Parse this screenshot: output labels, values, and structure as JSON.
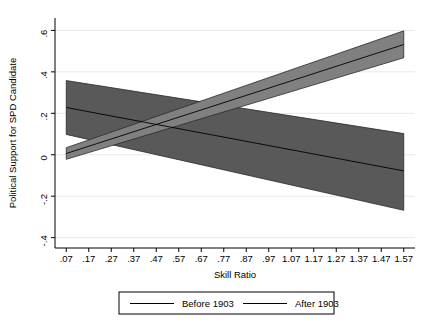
{
  "chart_data": {
    "type": "area",
    "title": "",
    "subtitle": "",
    "xlabel": "Skill Ratio",
    "ylabel": "Political Support for SPD Candidate",
    "xlim": [
      0.02,
      1.62
    ],
    "ylim": [
      -0.45,
      0.66
    ],
    "grid": true,
    "grid_orientation": "horizontal",
    "legend_position": "bottom",
    "x_ticks": [
      ".07",
      ".17",
      ".27",
      ".37",
      ".47",
      ".57",
      ".67",
      ".77",
      ".87",
      ".97",
      "1.07",
      "1.17",
      "1.27",
      "1.37",
      "1.47",
      "1.57"
    ],
    "x_tick_values": [
      0.07,
      0.17,
      0.27,
      0.37,
      0.47,
      0.57,
      0.67,
      0.77,
      0.87,
      0.97,
      1.07,
      1.17,
      1.27,
      1.37,
      1.47,
      1.57
    ],
    "y_ticks": [
      "-.4",
      "-.2",
      "0",
      ".2",
      ".4",
      ".6"
    ],
    "y_tick_values": [
      -0.4,
      -0.2,
      0,
      0.2,
      0.4,
      0.6
    ],
    "series": [
      {
        "name": "Before 1903",
        "color": "#595959",
        "x": [
          0.07,
          1.57
        ],
        "values": [
          0.228,
          -0.078
        ],
        "ci_lower": [
          0.098,
          -0.268
        ],
        "ci_upper": [
          0.358,
          0.102
        ]
      },
      {
        "name": "After 1903",
        "color": "#808080",
        "x": [
          0.07,
          1.57
        ],
        "values": [
          0.006,
          0.532
        ],
        "ci_lower": [
          -0.022,
          0.468
        ],
        "ci_upper": [
          0.034,
          0.598
        ]
      }
    ]
  },
  "legend": {
    "entries": [
      {
        "label": "Before 1903",
        "color": "#595959"
      },
      {
        "label": "After 1903",
        "color": "#595959"
      }
    ]
  }
}
